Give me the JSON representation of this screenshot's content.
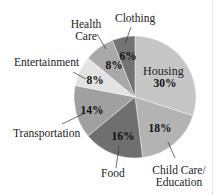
{
  "chart_data": {
    "type": "pie",
    "title": "",
    "start_angle_deg": 0,
    "direction": "clockwise",
    "slices": [
      {
        "label": "Housing",
        "value": 30,
        "display": "30%",
        "color": "#c6c6c6"
      },
      {
        "label": "Child Care/ Education",
        "value": 18,
        "display": "18%",
        "color": "#b3b3b3"
      },
      {
        "label": "Food",
        "value": 16,
        "display": "16%",
        "color": "#6f6f6f"
      },
      {
        "label": "Transportation",
        "value": 14,
        "display": "14%",
        "color": "#a0a0a0"
      },
      {
        "label": "Entertainment",
        "value": 8,
        "display": "8%",
        "color": "#e3e3e3"
      },
      {
        "label": "Health Care",
        "value": 8,
        "display": "8%",
        "color": "#a9a9a9"
      },
      {
        "label": "Clothing",
        "value": 6,
        "display": "6%",
        "color": "#737373"
      }
    ],
    "categories": [
      "Housing",
      "Child Care/Education",
      "Food",
      "Transportation",
      "Entertainment",
      "Health Care",
      "Clothing"
    ],
    "values": [
      30,
      18,
      16,
      14,
      8,
      8,
      6
    ],
    "unit": "%"
  },
  "labels": {
    "housing": "Housing",
    "housing_pct": "30%",
    "childcare_line1": "Child Care/",
    "childcare_line2": "Education",
    "childcare_pct": "18%",
    "food": "Food",
    "food_pct": "16%",
    "transportation": "Transportation",
    "transportation_pct": "14%",
    "entertainment": "Entertainment",
    "entertainment_pct": "8%",
    "health_line1": "Health",
    "health_line2": "Care",
    "health_pct": "8%",
    "clothing": "Clothing",
    "clothing_pct": "6%"
  }
}
